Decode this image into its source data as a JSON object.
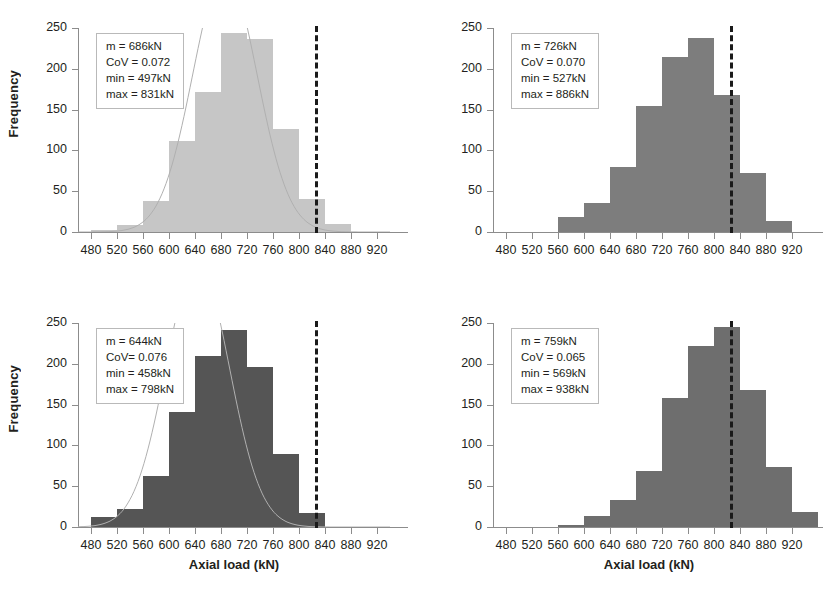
{
  "figure": {
    "background": "#ffffff",
    "panel_count": 4
  },
  "axes": {
    "y_title": "Frequency",
    "x_title": "Axial load (kN)",
    "y_ticks": [
      0,
      50,
      100,
      150,
      200,
      250
    ],
    "x_ticks": [
      480,
      520,
      560,
      600,
      640,
      680,
      720,
      760,
      800,
      840,
      880,
      920
    ],
    "y_min": 0,
    "y_max": 250,
    "x_min": 460,
    "x_max": 940
  },
  "colors": {
    "bar_light": "#c6c6c6",
    "bar_medium": "#7d7d7d",
    "bar_dark": "#555555",
    "bar_mid_dark": "#6e6e6e",
    "axis": "#8c8c8c",
    "text": "#231f20",
    "vline": "#1a1a1a",
    "curve": "#b0b0b0"
  },
  "chart_data": [
    {
      "type": "bar",
      "panel": "top-left",
      "title": "",
      "xlabel": "",
      "ylabel": "Frequency",
      "xlim": [
        460,
        940
      ],
      "ylim": [
        0,
        250
      ],
      "grid": false,
      "legend": "none",
      "bar_color": "#c6c6c6",
      "bin_width": 40,
      "bin_starts": [
        480,
        520,
        560,
        600,
        640,
        680,
        720,
        760,
        800,
        840
      ],
      "values": [
        2,
        8,
        38,
        112,
        172,
        244,
        236,
        126,
        40,
        10
      ],
      "normal_curve": true,
      "vline_x": 825,
      "stats": {
        "m": "m = 686kN",
        "cov": "CoV = 0.072",
        "min": "min = 497kN",
        "max": "max = 831kN"
      }
    },
    {
      "type": "bar",
      "panel": "top-right",
      "title": "",
      "xlabel": "",
      "ylabel": "",
      "xlim": [
        460,
        940
      ],
      "ylim": [
        0,
        250
      ],
      "grid": false,
      "legend": "none",
      "bar_color": "#7d7d7d",
      "bin_width": 40,
      "bin_starts": [
        560,
        600,
        640,
        680,
        720,
        760,
        800,
        840,
        880
      ],
      "values": [
        18,
        36,
        80,
        155,
        215,
        238,
        168,
        72,
        14
      ],
      "normal_curve": false,
      "vline_x": 825,
      "stats": {
        "m": "m = 726kN",
        "cov": "CoV = 0.070",
        "min": "min = 527kN",
        "max": "max = 886kN"
      }
    },
    {
      "type": "bar",
      "panel": "bottom-left",
      "title": "",
      "xlabel": "Axial load (kN)",
      "ylabel": "Frequency",
      "xlim": [
        460,
        940
      ],
      "ylim": [
        0,
        250
      ],
      "grid": false,
      "legend": "none",
      "bar_color": "#555555",
      "bin_width": 40,
      "bin_starts": [
        480,
        520,
        560,
        600,
        640,
        680,
        720,
        760,
        800
      ],
      "values": [
        12,
        22,
        62,
        141,
        210,
        241,
        196,
        89,
        17
      ],
      "normal_curve": true,
      "vline_x": 825,
      "stats": {
        "m": "m = 644kN",
        "cov": "CoV= 0.076",
        "min": "min = 458kN",
        "max": "max = 798kN"
      }
    },
    {
      "type": "bar",
      "panel": "bottom-right",
      "title": "",
      "xlabel": "Axial load (kN)",
      "ylabel": "",
      "xlim": [
        460,
        940
      ],
      "ylim": [
        0,
        250
      ],
      "grid": false,
      "legend": "none",
      "bar_color": "#6e6e6e",
      "bin_width": 40,
      "bin_starts": [
        560,
        600,
        640,
        680,
        720,
        760,
        800,
        840,
        880,
        920
      ],
      "values": [
        2,
        13,
        33,
        69,
        158,
        222,
        245,
        168,
        74,
        18
      ],
      "normal_curve": false,
      "vline_x": 825,
      "stats": {
        "m": "m = 759kN",
        "cov": "CoV = 0.065",
        "min": "min = 569kN",
        "max": "max = 938kN"
      }
    }
  ]
}
